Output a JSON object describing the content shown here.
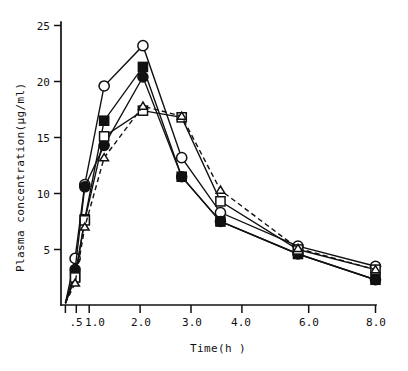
{
  "chart_data": {
    "type": "line",
    "title": "",
    "subtitle": "",
    "xlabel": "Time(h )",
    "ylabel": "Plasma concentration(µg/ml)",
    "xlim": [
      0,
      8
    ],
    "ylim": [
      0,
      25
    ],
    "xticks": [
      0,
      0.5,
      1.0,
      2.0,
      3.0,
      4.0,
      6.0,
      8.0
    ],
    "xticklabels": [
      "",
      ".5",
      "1.0",
      "2.0",
      "3.0",
      "4.0",
      "6.0",
      "8.0"
    ],
    "yticks": [
      5,
      10,
      15,
      20,
      25
    ],
    "yticklabels": [
      "5",
      "10",
      "15",
      "20",
      "25"
    ],
    "grid": false,
    "legend": "none",
    "x": [
      0,
      0.25,
      0.5,
      1.0,
      2.0,
      3.0,
      4.0,
      6.0,
      8.0
    ],
    "series": [
      {
        "name": "open-circle",
        "marker": "open-circle",
        "linestyle": "solid",
        "values": [
          0.2,
          4.2,
          10.8,
          19.6,
          23.2,
          13.2,
          8.3,
          5.3,
          3.5
        ]
      },
      {
        "name": "filled-square",
        "marker": "filled-square",
        "linestyle": "solid",
        "values": [
          0.2,
          2.6,
          7.7,
          16.5,
          21.3,
          11.5,
          7.5,
          4.6,
          2.3
        ]
      },
      {
        "name": "filled-circle",
        "marker": "filled-circle",
        "linestyle": "solid",
        "values": [
          0.2,
          3.2,
          10.6,
          14.3,
          20.4,
          11.5,
          7.5,
          4.6,
          2.3
        ]
      },
      {
        "name": "open-square",
        "marker": "open-square",
        "linestyle": "solid",
        "values": [
          0.2,
          2.5,
          7.6,
          15.1,
          17.4,
          16.8,
          9.3,
          5.0,
          3.2
        ]
      },
      {
        "name": "open-triangle",
        "marker": "open-triangle",
        "linestyle": "dashed",
        "values": [
          0.2,
          2.0,
          7.0,
          13.2,
          17.8,
          16.9,
          10.3,
          5.1,
          3.2
        ]
      }
    ]
  },
  "axes": {
    "y_axis_label": "Plasma concentration(µg/ml)",
    "x_axis_label": "Time(h )"
  }
}
